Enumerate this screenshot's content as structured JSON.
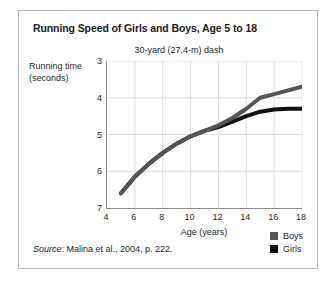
{
  "figure": {
    "title": "Running Speed of Girls and Boys, Age 5 to 18",
    "subtitle": "30-yard (27.4-m) dash",
    "source_prefix": "Source",
    "source_text": ": Malina et al., 2004, p. 222.",
    "border_color": "#b9b9b9",
    "axis_color": "#8b8b8b",
    "grid_color": "#dcdcdc"
  },
  "legend": {
    "position": "bottom-right",
    "entries": [
      {
        "label": "Boys",
        "color": "#555555"
      },
      {
        "label": "Girls",
        "color": "#111111"
      }
    ]
  },
  "chart_data": {
    "type": "line",
    "title": "Running Speed of Girls and Boys, Age 5 to 18",
    "subtitle": "30-yard (27.4-m) dash",
    "xlabel": "Age (years)",
    "ylabel": "Running time (seconds)",
    "xlim": [
      4,
      18
    ],
    "ylim": [
      3,
      7
    ],
    "y_inverted": true,
    "grid": true,
    "xticks": [
      4,
      6,
      8,
      10,
      12,
      14,
      16,
      18
    ],
    "yticks": [
      3,
      4,
      5,
      6,
      7
    ],
    "x": [
      5,
      6,
      7,
      8,
      9,
      10,
      11,
      12,
      13,
      14,
      15,
      16,
      17,
      18
    ],
    "series": [
      {
        "name": "Boys",
        "color": "#555555",
        "values": [
          6.6,
          6.15,
          5.8,
          5.5,
          5.25,
          5.05,
          4.9,
          4.75,
          4.55,
          4.3,
          4.0,
          3.9,
          3.8,
          3.7
        ]
      },
      {
        "name": "Girls",
        "color": "#111111",
        "values": [
          6.6,
          6.15,
          5.8,
          5.5,
          5.25,
          5.05,
          4.9,
          4.8,
          4.65,
          4.5,
          4.38,
          4.32,
          4.3,
          4.3
        ]
      }
    ]
  }
}
